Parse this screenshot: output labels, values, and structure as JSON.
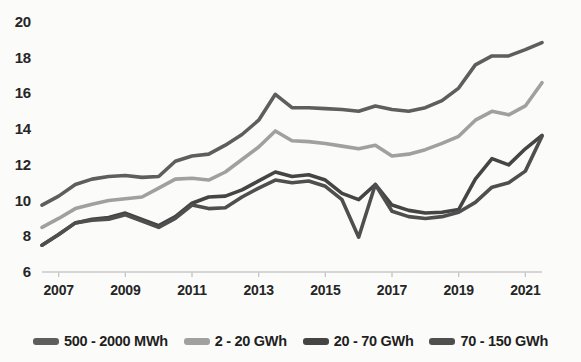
{
  "chart_data": {
    "type": "line",
    "title": "",
    "subtitle": "",
    "xlabel": "",
    "ylabel": "",
    "xlim": [
      2006.5,
      2021.5
    ],
    "ylim": [
      6,
      20
    ],
    "yticks": [
      6,
      8,
      10,
      12,
      14,
      16,
      18,
      20
    ],
    "xticks": [
      2007,
      2009,
      2011,
      2013,
      2015,
      2017,
      2019,
      2021
    ],
    "xtick_labels": [
      "2007",
      "2009",
      "2011",
      "2013",
      "2015",
      "2017",
      "2019",
      "2021"
    ],
    "ytick_labels": [
      "20",
      "18",
      "16",
      "14",
      "12",
      "10",
      "8",
      "6"
    ],
    "grid": false,
    "legend_position": "bottom",
    "x": [
      2006.5,
      2007.0,
      2007.5,
      2008.0,
      2008.5,
      2009.0,
      2009.5,
      2010.0,
      2010.5,
      2011.0,
      2011.5,
      2012.0,
      2012.5,
      2013.0,
      2013.5,
      2014.0,
      2014.5,
      2015.0,
      2015.5,
      2016.0,
      2016.5,
      2017.0,
      2017.5,
      2018.0,
      2018.5,
      2019.0,
      2019.5,
      2020.0,
      2020.5,
      2021.0,
      2021.5
    ],
    "series": [
      {
        "name": "500 - 2000 MWh",
        "color": "#5e5e5e",
        "values": [
          9.75,
          10.25,
          10.9,
          11.2,
          11.35,
          11.4,
          11.3,
          11.35,
          12.2,
          12.5,
          12.6,
          13.1,
          13.7,
          14.5,
          15.95,
          15.2,
          15.2,
          15.15,
          15.1,
          15.0,
          15.3,
          15.1,
          15.0,
          15.2,
          15.6,
          16.3,
          17.6,
          18.1,
          18.1,
          18.45,
          18.85
        ]
      },
      {
        "name": "2 - 20 GWh",
        "color": "#a0a0a0",
        "values": [
          8.5,
          9.0,
          9.55,
          9.8,
          10.0,
          10.1,
          10.2,
          10.7,
          11.2,
          11.25,
          11.15,
          11.6,
          12.3,
          13.0,
          13.9,
          13.35,
          13.3,
          13.2,
          13.05,
          12.9,
          13.1,
          12.5,
          12.6,
          12.85,
          13.2,
          13.6,
          14.5,
          15.0,
          14.8,
          15.3,
          16.6
        ]
      },
      {
        "name": "20 - 70 GWh",
        "color": "#454545",
        "values": [
          7.5,
          8.1,
          8.75,
          8.95,
          9.05,
          9.3,
          8.95,
          8.6,
          9.1,
          9.85,
          10.2,
          10.25,
          10.6,
          11.1,
          11.6,
          11.35,
          11.45,
          11.15,
          10.4,
          10.05,
          10.9,
          9.75,
          9.45,
          9.3,
          9.35,
          9.5,
          11.2,
          12.35,
          12.0,
          12.9,
          13.65
        ]
      },
      {
        "name": "70 - 150 GWh",
        "color": "#4f4f4f",
        "values": [
          7.5,
          8.1,
          8.75,
          8.9,
          8.95,
          9.2,
          8.85,
          8.5,
          9.0,
          9.75,
          9.55,
          9.6,
          10.2,
          10.7,
          11.15,
          11.0,
          11.1,
          10.8,
          10.05,
          7.95,
          10.9,
          9.4,
          9.1,
          9.0,
          9.1,
          9.35,
          9.9,
          10.75,
          11.0,
          11.65,
          13.6
        ]
      }
    ]
  },
  "legend": {
    "items": [
      {
        "label": "500 - 2000 MWh",
        "color": "#5e5e5e"
      },
      {
        "label": "2 - 20 GWh",
        "color": "#a0a0a0"
      },
      {
        "label": "20 - 70 GWh",
        "color": "#454545"
      },
      {
        "label": "70 - 150 GWh",
        "color": "#4f4f4f"
      }
    ]
  },
  "axis": {
    "axis_color": "#c8c8c8"
  }
}
